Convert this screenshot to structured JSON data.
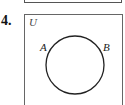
{
  "problem": {
    "number": "4.",
    "figure": {
      "type": "venn-diagram",
      "universe_label": "U",
      "sets": [
        {
          "label": "A"
        },
        {
          "label": "B"
        }
      ],
      "note": "Single circle representing both sets A and B (A = B)"
    }
  }
}
